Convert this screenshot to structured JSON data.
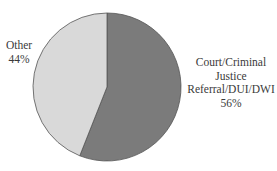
{
  "chart_data": {
    "type": "pie",
    "title": "",
    "slices": [
      {
        "label": "Court/Criminal Justice Referral/DUI/DWI",
        "value": 56,
        "display": "56%",
        "color": "#7b7b7b"
      },
      {
        "label": "Other",
        "value": 44,
        "display": "44%",
        "color": "#d9d9d9"
      }
    ],
    "start_angle_deg": 0,
    "direction": "clockwise",
    "legend": "none",
    "edge_color": "#555555"
  },
  "labels": {
    "other": {
      "line1": "Other",
      "line2": "44%"
    },
    "court": {
      "line1": "Court/Criminal",
      "line2": "Justice",
      "line3": "Referral/DUI/DWI",
      "line4": "56%"
    }
  }
}
